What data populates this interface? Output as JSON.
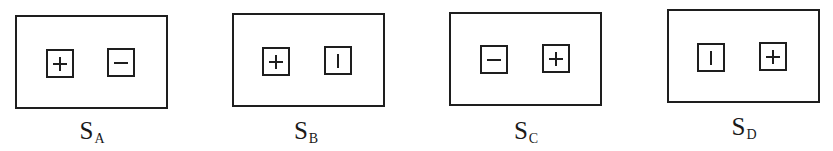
{
  "figure": {
    "panels": [
      {
        "id": "A",
        "label_main": "S",
        "label_sub": "A",
        "left_symbol": "+",
        "left_symbol_name": "plus",
        "right_symbol": "−",
        "right_symbol_name": "minus"
      },
      {
        "id": "B",
        "label_main": "S",
        "label_sub": "B",
        "left_symbol": "+",
        "left_symbol_name": "plus",
        "right_symbol": "|",
        "right_symbol_name": "vertical-bar"
      },
      {
        "id": "C",
        "label_main": "S",
        "label_sub": "C",
        "left_symbol": "−",
        "left_symbol_name": "minus",
        "right_symbol": "+",
        "right_symbol_name": "plus"
      },
      {
        "id": "D",
        "label_main": "S",
        "label_sub": "D",
        "left_symbol": "|",
        "left_symbol_name": "vertical-bar",
        "right_symbol": "+",
        "right_symbol_name": "plus"
      }
    ],
    "colors": {
      "stroke": "#1e1e1e",
      "background": "#ffffff"
    }
  }
}
